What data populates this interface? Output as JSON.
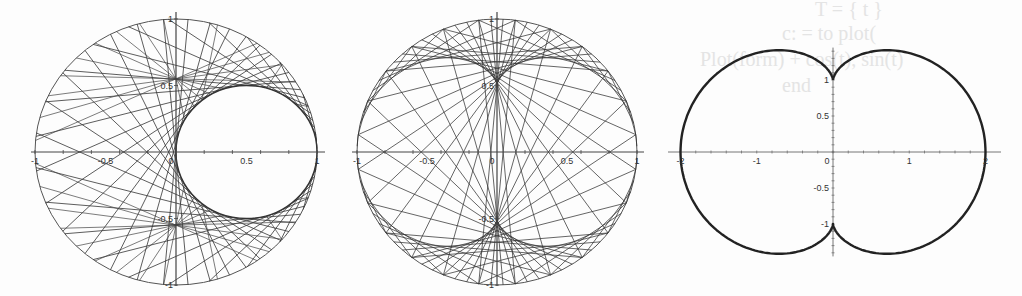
{
  "background_ghost_text": [
    "T = { t }",
    "c: = to plot(",
    "Plot(form) + cos(t), sin(t)",
    "end",
    "nephroid. Figure"
  ],
  "chart_data": [
    {
      "type": "line",
      "title": "",
      "description": "Chord envelope in unit circle forming a circular caustic on the right half",
      "xlabel": "",
      "ylabel": "",
      "xlim": [
        -1,
        1
      ],
      "ylim": [
        -1,
        1
      ],
      "x_ticks": [
        "-1",
        "-0.5",
        "0",
        "0.5",
        "1"
      ],
      "y_ticks": [
        "1",
        "0.5",
        "-0.5",
        "-1"
      ],
      "grid": false,
      "circle": {
        "cx": 0,
        "cy": 0,
        "r": 1
      },
      "envelope": {
        "shape": "circle",
        "cx": 0.5,
        "cy": 0,
        "r": 0.5
      },
      "line_count": 36,
      "frame": {
        "x0": 37,
        "x1": 319,
        "y_top": 16,
        "y_bottom": 282,
        "axis_y": 152,
        "axis_x": 176
      }
    },
    {
      "type": "line",
      "title": "",
      "description": "Chord envelope in unit circle forming a nephroid with cusps at (0, ±0.5)",
      "xlabel": "",
      "ylabel": "",
      "xlim": [
        -1,
        1
      ],
      "ylim": [
        -1,
        1
      ],
      "x_ticks": [
        "-1",
        "-0.5",
        "0",
        "0.5",
        "1"
      ],
      "y_ticks": [
        "1",
        "0.5",
        "-0.5",
        "-1"
      ],
      "grid": false,
      "circle": {
        "cx": 0,
        "cy": 0,
        "r": 1
      },
      "envelope": {
        "shape": "nephroid",
        "a": 0.25,
        "cusps_on": "y-axis"
      },
      "line_count": 72,
      "frame": {
        "x0": 358,
        "x1": 638,
        "y_top": 16,
        "y_bottom": 282,
        "axis_y": 152,
        "axis_x": 497
      }
    },
    {
      "type": "line",
      "title": "",
      "description": "Nephroid curve x = 0.5(3 sin t - sin 3t), y = 0.5(3 cos t - cos 3t)",
      "xlabel": "",
      "ylabel": "",
      "xlim": [
        -2,
        2
      ],
      "ylim": [
        -1.41,
        1.41
      ],
      "x_ticks": [
        "-2",
        "-1",
        "0",
        "1",
        "2"
      ],
      "y_ticks": [
        "1",
        "0.5",
        "-0.5",
        "-1"
      ],
      "grid": false,
      "curve": {
        "shape": "nephroid",
        "a": 0.5,
        "cusps": [
          [
            0,
            1
          ],
          [
            0,
            -1
          ]
        ],
        "x_extent": 2,
        "y_extent": 1.41
      },
      "frame": {
        "x_m2": 682,
        "x_p2": 987,
        "axis_y": 152,
        "axis_x": 833,
        "y_p1": 80,
        "y_m1": 224
      }
    }
  ]
}
